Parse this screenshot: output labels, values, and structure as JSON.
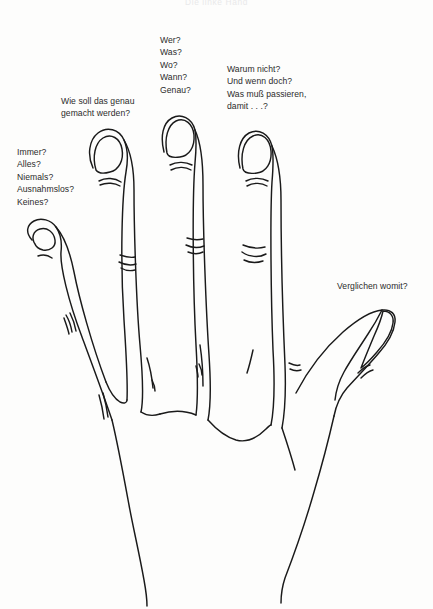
{
  "page": {
    "header": "Die linke Hand",
    "background_color": "#fdfdfc",
    "ink_color": "#1a1a1a",
    "width": 433,
    "height": 609
  },
  "figure": {
    "name": "hand-diagram"
  },
  "callouts": [
    {
      "id": "pinky",
      "name": "callout-pinky",
      "text": "Immer?\nAlles?\nNiemals?\nAusnahmslos?\nKeines?"
    },
    {
      "id": "ring",
      "name": "callout-ring",
      "text": "Wie soll das genau\ngemacht werden?"
    },
    {
      "id": "middle",
      "name": "callout-middle",
      "text": "Wer?\nWas?\nWo?\nWann?\nGenau?"
    },
    {
      "id": "index",
      "name": "callout-index",
      "text": "Warum nicht?\nUnd wenn doch?\nWas muß passieren,\ndamit . . .?"
    },
    {
      "id": "thumb",
      "name": "callout-thumb",
      "text": "Verglichen womit?"
    }
  ]
}
